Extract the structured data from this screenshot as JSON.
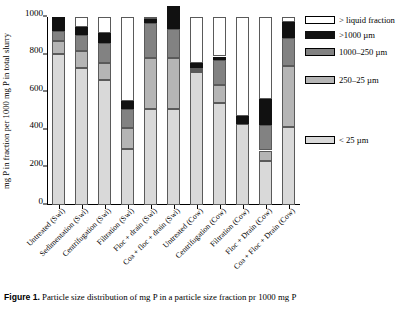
{
  "chart_data": {
    "type": "bar",
    "stacked": true,
    "title": "",
    "xlabel": "",
    "ylabel": "mg P in fraction per 1000 mg P in total slurry",
    "ylim": [
      0,
      1000
    ],
    "yticks": [
      0,
      200,
      400,
      600,
      800,
      1000
    ],
    "grid": false,
    "legend_position": "right",
    "categories": [
      "Untreated (Swi)",
      "Sedimentation (Swi)",
      "Centrifugation (Swi)",
      "Filtration (Swi)",
      "Floc + drain (Swi)",
      "Coa + floc + drain (Swi)",
      "Untreated (Cow)",
      "Centrifugation (Cow)",
      "Filtration (Cow)",
      "Floc + Drain (Cow)",
      "Coa + Floc + Drain (Cow)"
    ],
    "series": [
      {
        "name": "< 25 µm",
        "color": "#d9d9d9",
        "values": [
          805,
          730,
          665,
          300,
          510,
          510,
          710,
          545,
          430,
          235,
          415
        ]
      },
      {
        "name": "250–25 µm",
        "color": "#b5b5b5",
        "values": [
          65,
          90,
          90,
          110,
          270,
          270,
          10,
          95,
          0,
          55,
          325
        ]
      },
      {
        "name": "1000–250 µm",
        "color": "#828282",
        "values": [
          55,
          85,
          105,
          100,
          190,
          155,
          10,
          130,
          0,
          135,
          150
        ]
      },
      {
        "name": ">1000 µm",
        "color": "#111111",
        "values": [
          75,
          40,
          55,
          45,
          20,
          125,
          25,
          20,
          45,
          140,
          85
        ]
      },
      {
        "name": "> liquid fraction",
        "color": "#ffffff",
        "values": [
          0,
          55,
          85,
          445,
          10,
          0,
          245,
          210,
          525,
          435,
          25
        ]
      }
    ]
  },
  "legend": {
    "items": [
      {
        "label": "> liquid fraction",
        "color": "#ffffff"
      },
      {
        "label": ">1000 µm",
        "color": "#111111"
      },
      {
        "label": "1000–250 µm",
        "color": "#828282"
      },
      {
        "label": "250–25 µm",
        "color": "#b5b5b5"
      },
      {
        "label": "< 25 µm",
        "color": "#d9d9d9"
      }
    ]
  },
  "caption": {
    "label": "Figure 1.",
    "text": "Particle size distribution of mg P in a particle size fraction pr 1000 mg P"
  }
}
